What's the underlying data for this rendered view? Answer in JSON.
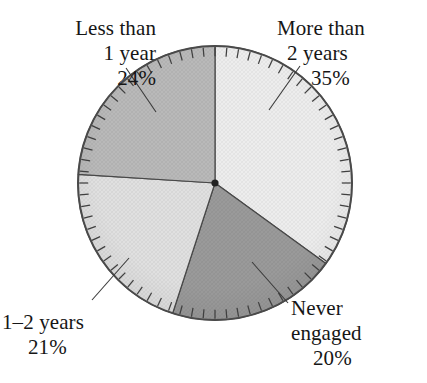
{
  "chart_data": {
    "type": "pie",
    "title": "",
    "xlabel": "",
    "ylabel": "",
    "legend_position": "callout-labels",
    "grid": false,
    "units": "percent",
    "center": {
      "x": 215,
      "y": 183
    },
    "radius": 137,
    "start_angle_deg": -90,
    "direction": "clockwise",
    "categories": [
      "More than 2 years",
      "Never engaged",
      "1-2 years",
      "Less than 1 year"
    ],
    "values": [
      35,
      20,
      21,
      24
    ],
    "slices": [
      {
        "name": "more-than-2-years",
        "label_lines": [
          "More than",
          "2 years",
          "35%"
        ],
        "value": 35,
        "value_text": "35%",
        "color": "#ededed",
        "start_deg": -90,
        "end_deg": 36,
        "sweep_deg": 126
      },
      {
        "name": "never-engaged",
        "label_lines": [
          "Never",
          "engaged",
          "20%"
        ],
        "value": 20,
        "value_text": "20%",
        "color": "#9a9a9a",
        "start_deg": 36,
        "end_deg": 108,
        "sweep_deg": 72
      },
      {
        "name": "one-to-two-years",
        "label_lines": [
          "1–2 years",
          "21%"
        ],
        "value": 21,
        "value_text": "21%",
        "color": "#e0e0e0",
        "start_deg": 108,
        "end_deg": 183.6,
        "sweep_deg": 75.6
      },
      {
        "name": "less-than-1-year",
        "label_lines": [
          "Less than",
          "1 year",
          "24%"
        ],
        "value": 24,
        "value_text": "24%",
        "color": "#b9b9b9",
        "start_deg": 183.6,
        "end_deg": 270,
        "sweep_deg": 86.4
      }
    ],
    "tick_marks": {
      "count": 72,
      "inward_length": 9
    },
    "outline_color": "#4a4a4a",
    "center_dot_color": "#222222"
  },
  "labels": {
    "less_than_1_year": {
      "line1": "Less than",
      "line2": "1 year",
      "line3": "24%"
    },
    "more_than_2_years": {
      "line1": "More than",
      "line2": "2 years",
      "line3": "35%"
    },
    "one_to_two_years": {
      "line1": "1–2 years",
      "line2": "21%"
    },
    "never_engaged": {
      "line1": "Never",
      "line2": "engaged",
      "line3": "20%"
    }
  },
  "cropped_heading": {
    "text": ""
  }
}
